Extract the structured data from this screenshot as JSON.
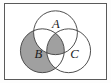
{
  "figure": {
    "kind": "venn-diagram",
    "set_count": 3,
    "frame": {
      "border_color": "#5a5a5a",
      "background_color": "#ffffff"
    },
    "style": {
      "outline_color": "#4a4a4a",
      "shaded_color": "#a0a0a0",
      "unshaded_color": "#ffffff",
      "label_color": "#1c1c1c"
    },
    "circles": [
      {
        "id": "A",
        "label": "A",
        "label_x": 52,
        "label_y": 22,
        "cx": 51.5,
        "cy": 29.5,
        "r": 22.5,
        "shaded": false
      },
      {
        "id": "B",
        "label": "B",
        "label_x": 34,
        "label_y": 52,
        "cx": 38.0,
        "cy": 48.0,
        "r": 22.5,
        "shaded": true
      },
      {
        "id": "C",
        "label": "C",
        "label_x": 71,
        "label_y": 52,
        "cx": 65.0,
        "cy": 48.0,
        "r": 22.5,
        "shaded": false
      }
    ],
    "shaded_regions": [
      {
        "name": "B-only",
        "sets_in": [
          "B"
        ],
        "sets_out": [
          "A",
          "C"
        ],
        "shaded": true
      },
      {
        "name": "A-intersect-B",
        "sets_in": [
          "A",
          "B"
        ],
        "sets_out": [
          "C"
        ],
        "shaded": true
      },
      {
        "name": "B-intersect-C",
        "sets_in": [
          "B",
          "C"
        ],
        "sets_out": [
          "A"
        ],
        "shaded": true
      },
      {
        "name": "A-intersect-B-intersect-C",
        "sets_in": [
          "A",
          "B",
          "C"
        ],
        "sets_out": [],
        "shaded": true
      }
    ],
    "unshaded_regions": [
      {
        "name": "A-only",
        "sets_in": [
          "A"
        ],
        "sets_out": [
          "B",
          "C"
        ],
        "shaded": false
      },
      {
        "name": "C-only",
        "sets_in": [
          "C"
        ],
        "sets_out": [
          "A",
          "B"
        ],
        "shaded": false
      },
      {
        "name": "A-intersect-C",
        "sets_in": [
          "A",
          "C"
        ],
        "sets_out": [
          "B"
        ],
        "shaded": false
      },
      {
        "name": "outside-all",
        "sets_in": [],
        "sets_out": [
          "A",
          "B",
          "C"
        ],
        "shaded": false
      }
    ]
  }
}
